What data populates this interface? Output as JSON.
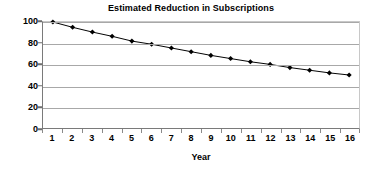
{
  "chart_data": {
    "type": "line",
    "title": "Estimated Reduction in Subscriptions",
    "xlabel": "Year",
    "ylabel": "",
    "categories": [
      "1",
      "2",
      "3",
      "4",
      "5",
      "6",
      "7",
      "8",
      "9",
      "10",
      "11",
      "12",
      "13",
      "14",
      "15",
      "16"
    ],
    "values": [
      100,
      95,
      90.5,
      86.5,
      82,
      79,
      75.5,
      72,
      68.5,
      65.5,
      62.5,
      60,
      57,
      54.5,
      52,
      50
    ],
    "series": [
      {
        "name": "Subscriptions",
        "values": [
          100,
          95,
          90.5,
          86.5,
          82,
          79,
          75.5,
          72,
          68.5,
          65.5,
          62.5,
          60,
          57,
          54.5,
          52,
          50
        ]
      }
    ],
    "ylim": [
      0,
      100
    ],
    "yticks": [
      "0",
      "20",
      "40",
      "60",
      "80",
      "100"
    ],
    "ytick_values": [
      0,
      20,
      40,
      60,
      80,
      100
    ],
    "grid": true,
    "grid_axis": "y",
    "legend": false,
    "legend_position": "none",
    "marker": "diamond",
    "line_color": "#000000",
    "marker_color": "#000000",
    "grid_color": "#a8a8a8",
    "axis_color": "#7a7a7a",
    "plot_background": "#ffffff"
  }
}
